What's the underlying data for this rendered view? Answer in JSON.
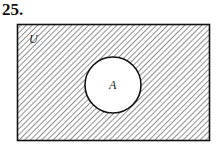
{
  "problem_number": "25.",
  "diagram": {
    "universe_label": "U",
    "set_label": "A",
    "shaded_region": "complement of A (U minus A)",
    "line_color": "#111111",
    "hatch_color": "#555555"
  }
}
